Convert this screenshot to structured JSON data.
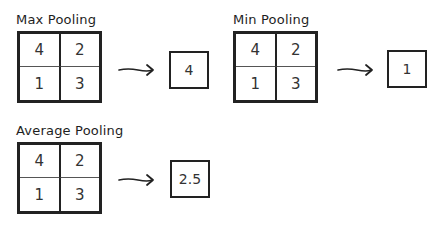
{
  "diagrams": [
    {
      "title": "Max Pooling",
      "grid": [
        "4",
        "2",
        "1",
        "3"
      ],
      "result": "4"
    },
    {
      "title": "Min Pooling",
      "grid": [
        "4",
        "2",
        "1",
        "3"
      ],
      "result": "1"
    },
    {
      "title": "Average Pooling",
      "grid": [
        "4",
        "2",
        "1",
        "3"
      ],
      "result": "2.5"
    }
  ]
}
